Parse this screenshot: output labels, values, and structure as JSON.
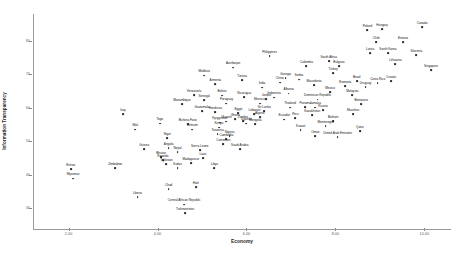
{
  "chart_data": {
    "type": "scatter",
    "title": "",
    "xlabel": "Economy",
    "ylabel": "Information Transparency",
    "xlim": [
      1.2,
      10.6
    ],
    "ylim": [
      24,
      88
    ],
    "grid": false,
    "legend": "none",
    "xticks": [
      "2.00",
      "4.00",
      "6.00",
      "8.00",
      "10.00"
    ],
    "xtickvalues": [
      2,
      4,
      6,
      8,
      10
    ],
    "yticks": [
      "80",
      "70",
      "60",
      "50",
      "40",
      "30"
    ],
    "ytickvalues": [
      80,
      70,
      60,
      50,
      40,
      30
    ],
    "point_color": "#2b2b2b",
    "axis_color": "#9a9a9a",
    "points": [
      {
        "label": "Eritrea",
        "x": 2.05,
        "y": 41.5
      },
      {
        "label": "Myanmar",
        "x": 2.1,
        "y": 38.8
      },
      {
        "label": "Zimbabwe",
        "x": 3.05,
        "y": 41.8
      },
      {
        "label": "Liberia",
        "x": 3.55,
        "y": 33.2
      },
      {
        "label": "Chad",
        "x": 4.25,
        "y": 35.6
      },
      {
        "label": "Central African Republic",
        "x": 4.6,
        "y": 31.0
      },
      {
        "label": "Turkmenistan",
        "x": 4.62,
        "y": 28.4
      },
      {
        "label": "Sudan",
        "x": 4.45,
        "y": 42.0
      },
      {
        "label": "Haiti",
        "x": 4.86,
        "y": 36.2
      },
      {
        "label": "Guinea",
        "x": 3.7,
        "y": 47.6
      },
      {
        "label": "Tajikistan",
        "x": 4.2,
        "y": 43.1
      },
      {
        "label": "Bhutan",
        "x": 4.08,
        "y": 45.3
      },
      {
        "label": "Rwanda",
        "x": 4.12,
        "y": 44.2
      },
      {
        "label": "Angola",
        "x": 4.25,
        "y": 48.0
      },
      {
        "label": "Nepal",
        "x": 4.45,
        "y": 46.6
      },
      {
        "label": "Laos",
        "x": 5.02,
        "y": 45.0
      },
      {
        "label": "Madagascar",
        "x": 4.75,
        "y": 43.3
      },
      {
        "label": "Niger",
        "x": 4.22,
        "y": 51.0
      },
      {
        "label": "Mali",
        "x": 3.5,
        "y": 53.4
      },
      {
        "label": "Togo",
        "x": 4.05,
        "y": 55.2
      },
      {
        "label": "Iraq",
        "x": 3.22,
        "y": 58.0
      },
      {
        "label": "Burkina Faso",
        "x": 4.68,
        "y": 55.0
      },
      {
        "label": "Vietnam",
        "x": 4.78,
        "y": 53.4
      },
      {
        "label": "Kenya",
        "x": 5.38,
        "y": 54.0
      },
      {
        "label": "Tanzania",
        "x": 5.35,
        "y": 52.2
      },
      {
        "label": "Cambodia",
        "x": 5.55,
        "y": 50.6
      },
      {
        "label": "Nigeria",
        "x": 5.62,
        "y": 51.4
      },
      {
        "label": "Cameroon",
        "x": 5.48,
        "y": 49.0
      },
      {
        "label": "Sierra Leone",
        "x": 4.95,
        "y": 47.3
      },
      {
        "label": "Libya",
        "x": 5.28,
        "y": 42.0
      },
      {
        "label": "Saudi Arabia",
        "x": 5.85,
        "y": 47.5
      },
      {
        "label": "Mozambique",
        "x": 4.55,
        "y": 61.0
      },
      {
        "label": "Guatemala",
        "x": 5.0,
        "y": 59.0
      },
      {
        "label": "Venezuela",
        "x": 4.82,
        "y": 63.8
      },
      {
        "label": "Senegal",
        "x": 5.05,
        "y": 62.2
      },
      {
        "label": "Bolivia",
        "x": 5.45,
        "y": 63.6
      },
      {
        "label": "Paraguay",
        "x": 5.55,
        "y": 61.2
      },
      {
        "label": "Nicaragua",
        "x": 5.95,
        "y": 63.2
      },
      {
        "label": "Honduras",
        "x": 5.3,
        "y": 58.6
      },
      {
        "label": "Egypt",
        "x": 5.82,
        "y": 58.4
      },
      {
        "label": "Lebanon",
        "x": 6.18,
        "y": 58.0
      },
      {
        "label": "Armenia",
        "x": 5.3,
        "y": 67.0
      },
      {
        "label": "Moldova",
        "x": 5.05,
        "y": 69.6
      },
      {
        "label": "Tunisia",
        "x": 5.9,
        "y": 68.2
      },
      {
        "label": "Azerbaijan",
        "x": 5.7,
        "y": 72.0
      },
      {
        "label": "Philippines",
        "x": 6.52,
        "y": 75.5
      },
      {
        "label": "Ukraine",
        "x": 5.55,
        "y": 55.8
      },
      {
        "label": "Kyrgyzstan",
        "x": 5.4,
        "y": 55.5
      },
      {
        "label": "Uganda",
        "x": 6.0,
        "y": 55.2
      },
      {
        "label": "Mongolia",
        "x": 6.2,
        "y": 55.0
      },
      {
        "label": "Ghana",
        "x": 5.75,
        "y": 56.5
      },
      {
        "label": "Zambia",
        "x": 5.92,
        "y": 56.0
      },
      {
        "label": "Algeria",
        "x": 6.3,
        "y": 57.2
      },
      {
        "label": "Sri Lanka",
        "x": 6.4,
        "y": 59.0
      },
      {
        "label": "Morocco",
        "x": 6.3,
        "y": 61.2
      },
      {
        "label": "Jordan",
        "x": 6.45,
        "y": 62.5
      },
      {
        "label": "Colombia",
        "x": 7.35,
        "y": 72.5
      },
      {
        "label": "Georgia",
        "x": 6.88,
        "y": 68.8
      },
      {
        "label": "Serbia",
        "x": 7.18,
        "y": 68.4
      },
      {
        "label": "Macedonia",
        "x": 7.52,
        "y": 66.8
      },
      {
        "label": "South Africa",
        "x": 7.85,
        "y": 74.0
      },
      {
        "label": "Turkey",
        "x": 7.95,
        "y": 70.4
      },
      {
        "label": "Brazil",
        "x": 8.48,
        "y": 68.0
      },
      {
        "label": "Romania",
        "x": 8.22,
        "y": 66.4
      },
      {
        "label": "Mexico",
        "x": 7.88,
        "y": 64.6
      },
      {
        "label": "Malaysia",
        "x": 8.38,
        "y": 63.8
      },
      {
        "label": "Uruguay",
        "x": 8.68,
        "y": 66.2
      },
      {
        "label": "Costa Rica",
        "x": 8.95,
        "y": 67.4
      },
      {
        "label": "Croatia",
        "x": 9.25,
        "y": 68.0
      },
      {
        "label": "Botswana",
        "x": 8.58,
        "y": 61.0
      },
      {
        "label": "Mauritius",
        "x": 8.4,
        "y": 58.0
      },
      {
        "label": "Thailand",
        "x": 6.98,
        "y": 60.0
      },
      {
        "label": "Panama",
        "x": 7.32,
        "y": 60.2
      },
      {
        "label": "Dominican Republic",
        "x": 7.6,
        "y": 62.4
      },
      {
        "label": "Jamaica",
        "x": 7.55,
        "y": 60.0
      },
      {
        "label": "Russia",
        "x": 7.72,
        "y": 59.2
      },
      {
        "label": "Kazakhstan",
        "x": 7.48,
        "y": 57.8
      },
      {
        "label": "Peru",
        "x": 7.1,
        "y": 56.8
      },
      {
        "label": "Ecuador",
        "x": 6.85,
        "y": 56.4
      },
      {
        "label": "Bahrain",
        "x": 7.95,
        "y": 56.0
      },
      {
        "label": "Montenegro",
        "x": 7.78,
        "y": 54.4
      },
      {
        "label": "Kuwait",
        "x": 7.22,
        "y": 53.2
      },
      {
        "label": "Oman",
        "x": 7.55,
        "y": 51.5
      },
      {
        "label": "United Arab Emirates",
        "x": 8.05,
        "y": 51.2
      },
      {
        "label": "Qatar",
        "x": 8.55,
        "y": 53.0
      },
      {
        "label": "Latvia",
        "x": 8.78,
        "y": 76.4
      },
      {
        "label": "South Korea",
        "x": 9.18,
        "y": 76.2
      },
      {
        "label": "Chile",
        "x": 8.92,
        "y": 79.5
      },
      {
        "label": "Poland",
        "x": 8.72,
        "y": 83.2
      },
      {
        "label": "Hungary",
        "x": 9.05,
        "y": 83.4
      },
      {
        "label": "Canada",
        "x": 9.95,
        "y": 84.0
      },
      {
        "label": "Estonia",
        "x": 9.52,
        "y": 79.6
      },
      {
        "label": "Slovenia",
        "x": 9.82,
        "y": 75.6
      },
      {
        "label": "Lithuania",
        "x": 9.35,
        "y": 73.0
      },
      {
        "label": "Singapore",
        "x": 10.15,
        "y": 71.2
      },
      {
        "label": "Bulgaria",
        "x": 8.08,
        "y": 72.4
      },
      {
        "label": "Albania",
        "x": 6.95,
        "y": 64.2
      },
      {
        "label": "Indonesia",
        "x": 6.62,
        "y": 63.0
      },
      {
        "label": "India",
        "x": 6.35,
        "y": 66.0
      },
      {
        "label": "China",
        "x": 6.75,
        "y": 67.5
      }
    ]
  }
}
